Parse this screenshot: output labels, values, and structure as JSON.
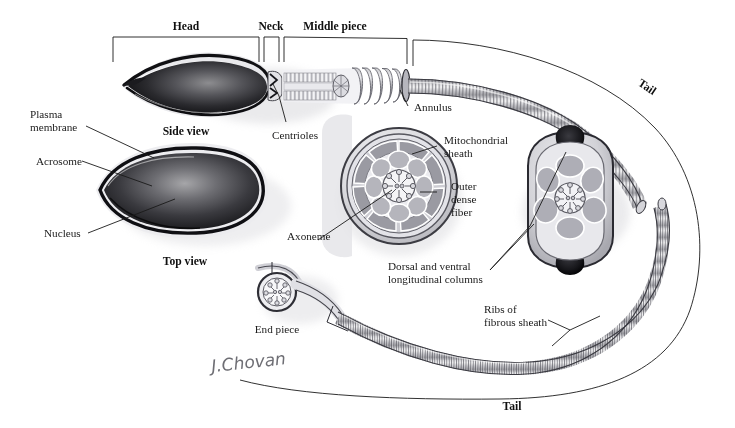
{
  "figure": {
    "background_color": "#ffffff",
    "ink_color": "#1a1a1a",
    "signature": "J.Chovan"
  },
  "region_brackets": [
    {
      "id": "head",
      "label": "Head"
    },
    {
      "id": "neck",
      "label": "Neck"
    },
    {
      "id": "middle_piece",
      "label": "Middle piece"
    },
    {
      "id": "tail_top",
      "label": "Tail"
    },
    {
      "id": "tail_bottom",
      "label": "Tail"
    }
  ],
  "view_captions": [
    {
      "id": "side_view",
      "label": "Side view"
    },
    {
      "id": "top_view",
      "label": "Top view"
    },
    {
      "id": "end_piece",
      "label": "End piece"
    }
  ],
  "callouts": [
    {
      "id": "plasma-membrane",
      "line1": "Plasma",
      "line2": "membrane"
    },
    {
      "id": "acrosome",
      "line1": "Acrosome",
      "line2": ""
    },
    {
      "id": "nucleus",
      "line1": "Nucleus",
      "line2": ""
    },
    {
      "id": "centrioles",
      "line1": "Centrioles",
      "line2": ""
    },
    {
      "id": "annulus",
      "line1": "Annulus",
      "line2": ""
    },
    {
      "id": "mitochondrial-sheath",
      "line1": "Mitochondrial",
      "line2": "sheath"
    },
    {
      "id": "outer-dense-fiber",
      "line1": "Outer",
      "line2": "dense",
      "line3": "fiber"
    },
    {
      "id": "axoneme",
      "line1": "Axoneme",
      "line2": ""
    },
    {
      "id": "longitudinal-columns",
      "line1": "Dorsal and ventral",
      "line2": "longitudinal columns"
    },
    {
      "id": "ribs-fibrous-sheath",
      "line1": "Ribs of",
      "line2": "fibrous sheath"
    }
  ]
}
